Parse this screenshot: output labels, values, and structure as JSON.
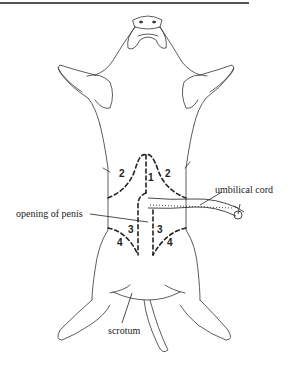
{
  "diagram": {
    "labels": {
      "umbilical_cord": "umbilical cord",
      "opening_of_penis": "opening of penis",
      "scrotum": "scrotum"
    },
    "regions": {
      "r1": "1",
      "r2_left": "2",
      "r2_right": "2",
      "r3_left": "3",
      "r3_right": "3",
      "r4_left": "4",
      "r4_right": "4"
    }
  }
}
